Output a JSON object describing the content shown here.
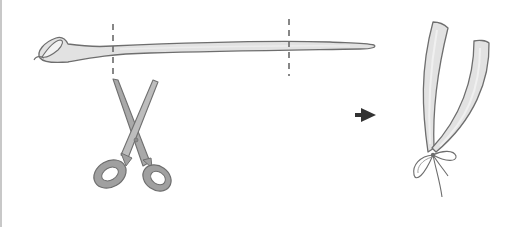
{
  "illustration": {
    "description": "Step illustration: cut a long tube at two dashed lines with scissors, then tie the two resulting strips together with a bow",
    "steps": [
      {
        "name": "cut",
        "elements": [
          "long-tube",
          "cut-line-left",
          "cut-line-right",
          "scissors"
        ]
      },
      {
        "name": "result",
        "elements": [
          "two-strips",
          "bow-knot"
        ]
      }
    ],
    "arrow": "right-arrow",
    "colors": {
      "tube_fill": "#e2e2e2",
      "outline": "#6e6e6e",
      "scissors_fill": "#a9a9a9",
      "scissors_outline": "#707070",
      "dash": "#6a6a6a",
      "arrow": "#333333",
      "border": "#c8c8c8",
      "background": "#ffffff"
    },
    "icons": [
      "scissors-icon",
      "right-arrow-icon",
      "bow-icon"
    ]
  }
}
